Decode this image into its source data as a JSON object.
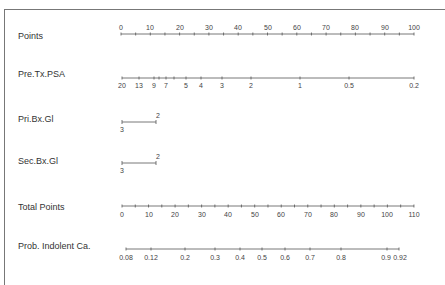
{
  "chart_data": {
    "type": "nomogram",
    "title": "",
    "rows": [
      {
        "label": "Points",
        "ticks": [
          0,
          10,
          20,
          30,
          40,
          50,
          60,
          70,
          80,
          90,
          100
        ],
        "range": [
          0,
          100
        ],
        "label_position": "above"
      },
      {
        "label": "Pre.Tx.PSA",
        "ticks": [
          "20",
          "13",
          "9",
          "7",
          "5",
          "4",
          "3",
          "2",
          "1",
          "0.5",
          "0.2"
        ],
        "minor_ticks": [
          "8",
          "6"
        ],
        "range": [
          20,
          0.2
        ],
        "label_position": "below"
      },
      {
        "label": "Pri.Bx.Gl",
        "ticks": [
          "3",
          "2"
        ],
        "points": [
          0,
          12
        ],
        "label_position": "mixed"
      },
      {
        "label": "Sec.Bx.Gl",
        "ticks": [
          "3",
          "2"
        ],
        "points": [
          0,
          12
        ],
        "label_position": "mixed"
      },
      {
        "label": "Total Points",
        "ticks": [
          0,
          10,
          20,
          30,
          40,
          50,
          60,
          70,
          80,
          90,
          100,
          110
        ],
        "range": [
          0,
          110
        ],
        "label_position": "below"
      },
      {
        "label": "Prob. Indolent Ca.",
        "ticks": [
          "0.08",
          "0.12",
          "0.2",
          "0.3",
          "0.4",
          "0.5",
          "0.6",
          "0.7",
          "0.8",
          "0.9",
          "0.92"
        ],
        "range": [
          0.08,
          0.92
        ],
        "label_position": "below"
      }
    ]
  },
  "labels": {
    "points": "Points",
    "psa": "Pre.Tx.PSA",
    "pri": "Pri.Bx.Gl",
    "sec": "Sec.Bx.Gl",
    "total": "Total Points",
    "prob": "Prob. Indolent Ca."
  },
  "axes": {
    "points": {
      "ticks": [
        "0",
        "10",
        "20",
        "30",
        "40",
        "50",
        "60",
        "70",
        "80",
        "90",
        "100"
      ]
    },
    "psa": {
      "ticks": [
        "20",
        "13",
        "9",
        "7",
        "5",
        "4",
        "3",
        "2",
        "1",
        "0.5",
        "0.2"
      ]
    },
    "pri": {
      "low": "3",
      "high": "2"
    },
    "sec": {
      "low": "3",
      "high": "2"
    },
    "total": {
      "ticks": [
        "0",
        "10",
        "20",
        "30",
        "40",
        "50",
        "60",
        "70",
        "80",
        "90",
        "100",
        "110"
      ]
    },
    "prob": {
      "ticks": [
        "0.08",
        "0.12",
        "0.2",
        "0.3",
        "0.4",
        "0.5",
        "0.6",
        "0.7",
        "0.8",
        "0.9",
        "0.92"
      ]
    }
  }
}
